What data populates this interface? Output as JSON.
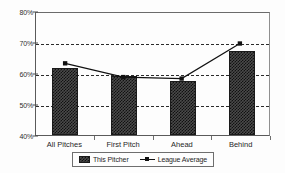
{
  "chart_data": {
    "type": "bar",
    "title": "",
    "subtitle": "",
    "xlabel": "",
    "ylabel": "",
    "categories": [
      "All Pitches",
      "First Pitch",
      "Ahead",
      "Behind"
    ],
    "ylim": [
      40,
      80
    ],
    "ytick_values": [
      40,
      50,
      60,
      70,
      80
    ],
    "ytick_labels": [
      "40%",
      "50%",
      "60%",
      "70%",
      "80%"
    ],
    "gridlines_at": [
      50,
      60,
      70
    ],
    "grid": true,
    "legend_position": "bottom-center",
    "series": [
      {
        "name": "This Pitcher",
        "type": "bar",
        "values": [
          61.5,
          59.0,
          57.5,
          67.0
        ],
        "color": "#4a4a4a"
      },
      {
        "name": "League Average",
        "type": "line",
        "values": [
          63.5,
          59.0,
          58.5,
          70.0
        ],
        "color": "#111111",
        "marker": "square"
      }
    ]
  },
  "legend": {
    "items": [
      {
        "label": "This Pitcher",
        "swatch": "hatched-bar-swatch"
      },
      {
        "label": "League Average",
        "swatch": "line-marker-swatch"
      }
    ]
  },
  "axis": {
    "y_labels": [
      "80%",
      "70%",
      "60%",
      "50%",
      "40%"
    ],
    "x_labels": [
      "All Pitches",
      "First Pitch",
      "Ahead",
      "Behind"
    ]
  }
}
